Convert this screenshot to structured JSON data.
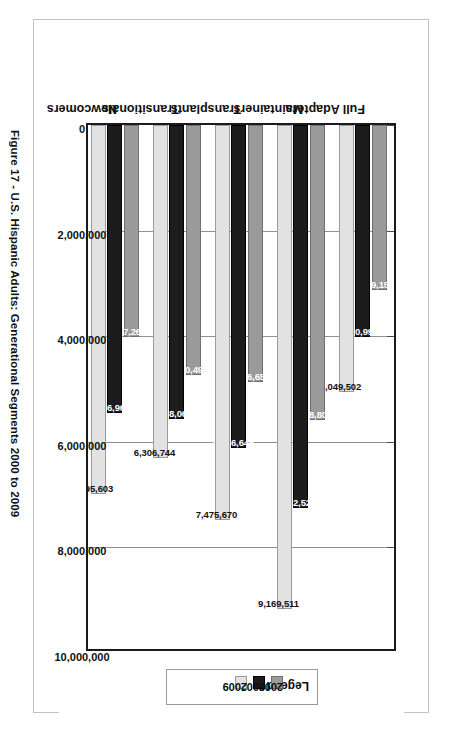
{
  "figure": {
    "caption": "Figure 17 - U.S. Hispanic Adults: Generational Segments 2000 to 2009"
  },
  "legend": {
    "title": "Legend",
    "entries": [
      {
        "label": "2000",
        "color": "#9a9a9a"
      },
      {
        "label": "2004",
        "color": "#1c1c1c"
      },
      {
        "label": "2009",
        "color": "#e2e2e2"
      }
    ]
  },
  "axis": {
    "ticks": [
      "0",
      "2,000,000",
      "4,000,000",
      "6,000,000",
      "8,000,000",
      "10,000,000"
    ],
    "tick_values": [
      0,
      2000000,
      4000000,
      6000000,
      8000000,
      10000000
    ]
  },
  "chart_data": {
    "type": "bar",
    "title": "Figure 17 - U.S. Hispanic Adults: Generational Segments 2000 to 2009",
    "orientation": "vertical-rotated",
    "xlabel": "",
    "ylabel": "",
    "ylim": [
      0,
      10000000
    ],
    "grid": true,
    "legend_position": "right",
    "categories": [
      "Full Adapters",
      "Maintainers",
      "Transplants",
      "Transitionals",
      "Newcomers"
    ],
    "series": [
      {
        "name": "2000",
        "color": "#9a9a9a",
        "values": [
          3129159,
          5578802,
          4866652,
          4730490,
          4017261
        ],
        "labels": [
          "3,129,159",
          "5,578,802",
          "4,866,652",
          "4,730,490",
          "4,017,261"
        ]
      },
      {
        "name": "2004",
        "color": "#1c1c1c",
        "values": [
          4020993,
          7262521,
          6126646,
          5568068,
          5456967
        ],
        "labels": [
          "4,020,993",
          "7,262,521",
          "6,126,646",
          "5,568,068",
          "5,456,967"
        ]
      },
      {
        "name": "2009",
        "color": "#e2e2e2",
        "values": [
          5049502,
          9169511,
          7475670,
          6306744,
          6995603
        ],
        "labels": [
          "5,049,502",
          "9,169,511",
          "7,475,670",
          "6,306,744",
          "6,995,603"
        ]
      }
    ]
  }
}
